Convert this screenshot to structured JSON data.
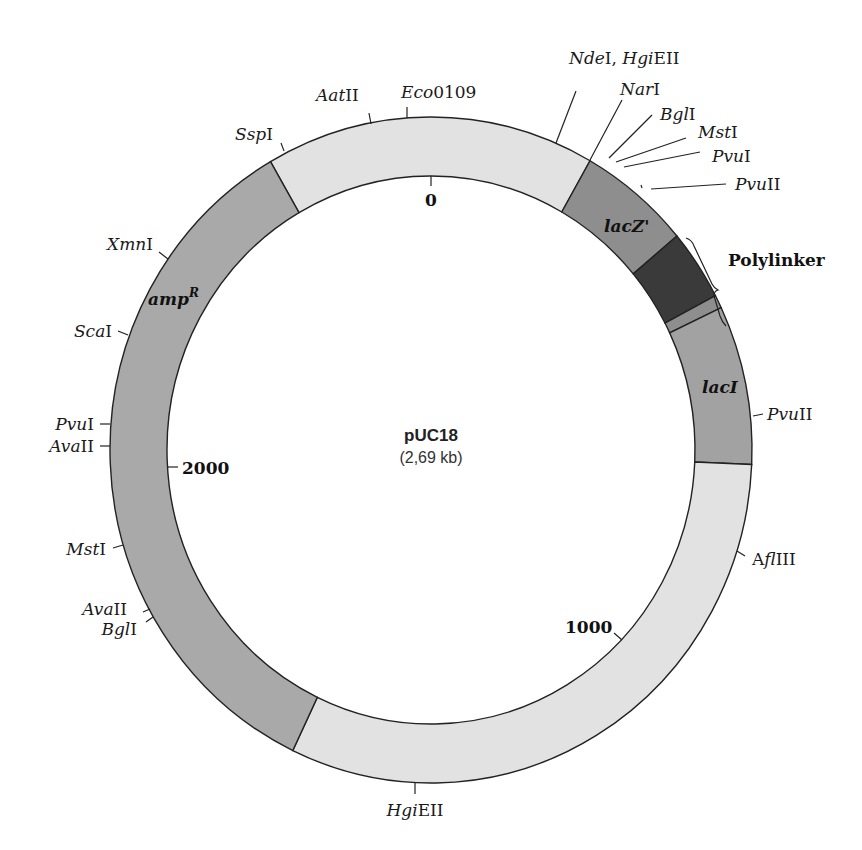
{
  "plasmid": {
    "name": "pUC18",
    "size_label": "(2,69 kb)"
  },
  "colors": {
    "backbone": "#e2e2e2",
    "amp": "#a9a9a9",
    "lacZ": "#8e8e8e",
    "polylinker": "#3a3a3a",
    "lacI": "#a2a2a2",
    "outline": "#222222"
  },
  "segments": [
    {
      "id": "backbone-top",
      "label": "",
      "start_deg": 330,
      "end_deg": 29.7,
      "color_key": "backbone"
    },
    {
      "id": "lacZ",
      "label": "lacZ'",
      "start_deg": 29.7,
      "end_deg": 50,
      "color_key": "lacZ"
    },
    {
      "id": "polylinker",
      "label": "Polylinker",
      "start_deg": 50,
      "end_deg": 62.4,
      "color_key": "polylinker"
    },
    {
      "id": "lacZ-stripe",
      "label": "",
      "start_deg": 62.4,
      "end_deg": 64.7,
      "color_key": "lacZ"
    },
    {
      "id": "lacI",
      "label": "lacI",
      "start_deg": 64.7,
      "end_deg": 92.5,
      "color_key": "lacI"
    },
    {
      "id": "backbone-bottom",
      "label": "",
      "start_deg": 92.5,
      "end_deg": 205.5,
      "color_key": "backbone"
    },
    {
      "id": "ampR",
      "label": "ampR",
      "start_deg": 205.5,
      "end_deg": 330,
      "color_key": "amp"
    }
  ],
  "labels": {
    "lacZ": "lacZ'",
    "lacI": "lacI",
    "amp_base": "amp",
    "amp_sup": "R",
    "polylinker": "Polylinker"
  },
  "scale_marks": [
    {
      "label": "0",
      "deg": 0
    },
    {
      "label": "1000",
      "deg": 134
    },
    {
      "label": "2000",
      "deg": 268
    }
  ],
  "restriction_sites": [
    {
      "name_italic": "Ssp",
      "name_roman": "I"
    },
    {
      "name_italic": "Aat",
      "name_roman": "II"
    },
    {
      "name_italic": "Eco",
      "name_roman": "0109"
    },
    {
      "name_italic": "Nde",
      "name_roman": "I, ",
      "name_italic2": "Hgi",
      "name_roman2": "EII"
    },
    {
      "name_italic": "Nar",
      "name_roman": "I"
    },
    {
      "name_italic": "Bgl",
      "name_roman": "I"
    },
    {
      "name_italic": "Mst",
      "name_roman": "I"
    },
    {
      "name_italic": "Pvu",
      "name_roman": "I"
    },
    {
      "name_italic": "Pvu",
      "name_roman": "II"
    },
    {
      "name_italic": "Pvu",
      "name_roman": "II"
    },
    {
      "name_roman_pre": "A",
      "name_italic": "fl",
      "name_roman": "III"
    },
    {
      "name_italic": "Hgi",
      "name_roman": "EII"
    },
    {
      "name_italic": "Bgl",
      "name_roman": "I"
    },
    {
      "name_italic": "Ava",
      "name_roman": "II"
    },
    {
      "name_italic": "Mst",
      "name_roman": "I"
    },
    {
      "name_italic": "Ava",
      "name_roman": "II"
    },
    {
      "name_italic": "Pvu",
      "name_roman": "I"
    },
    {
      "name_italic": "Sca",
      "name_roman": "I"
    },
    {
      "name_italic": "Xmn",
      "name_roman": "I"
    }
  ]
}
